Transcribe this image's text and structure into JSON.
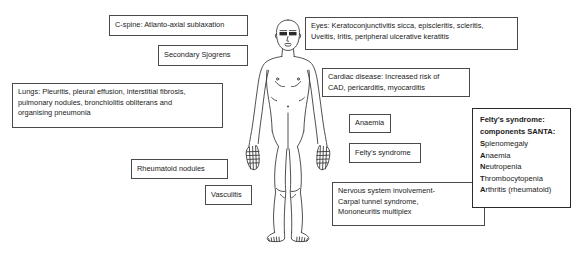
{
  "diagram": {
    "figure_name": "human-body-outline",
    "background_color": "#ffffff",
    "line_color": "#4a4a4a",
    "text_color": "#1a1a1a"
  },
  "labels": {
    "cspine": "C-spine: Atlanto-axial sublaxation",
    "sjogrens": "Secondary Sjogrens",
    "lungs": "Lungs: Pleuritis, pleural effusion, interstitial fibrosis,\npulmonary nodules, bronchiolitis obliterans and\norganising pneumonia",
    "eyes": "Eyes: Keratoconjunctivitis sicca, episcleritis, scleritis,\nUveitis, Iritis, peripheral ulcerative keratitis",
    "cardiac": "Cardiac disease: Increased risk of\nCAD, pericarditis, myocarditis",
    "anaemia": "Anaemia",
    "felty": "Felty's syndrome",
    "rheumatoid_nodules": "Rheumatoid nodules",
    "vasculitis": "Vasculitis",
    "nervous": "Nervous system involvement-\nCarpal tunnel syndrome,\nMononeuritis multiplex"
  },
  "santa": {
    "heading": "Felty's syndrome:\ncomponents SANTA:",
    "items": [
      {
        "initial": "S",
        "rest": "plenomegaly"
      },
      {
        "initial": "A",
        "rest": "naemia"
      },
      {
        "initial": "N",
        "rest": "eutropenia"
      },
      {
        "initial": "T",
        "rest": "hrombocytopenia"
      },
      {
        "initial": "A",
        "rest": "rthritis (rheumatoid)"
      }
    ]
  }
}
